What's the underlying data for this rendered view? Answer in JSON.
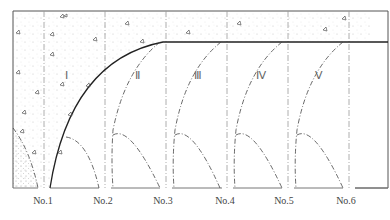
{
  "diagram": {
    "regions": [
      {
        "id": "I",
        "label": "Ⅰ",
        "x": 66,
        "y": 75
      },
      {
        "id": "II",
        "label": "Ⅱ",
        "x": 137,
        "y": 75
      },
      {
        "id": "III",
        "label": "Ⅲ",
        "x": 198,
        "y": 75
      },
      {
        "id": "IV",
        "label": "Ⅳ",
        "x": 261,
        "y": 75
      },
      {
        "id": "V",
        "label": "Ⅴ",
        "x": 319,
        "y": 75
      }
    ],
    "sections": [
      {
        "label": "No.1",
        "x": 43
      },
      {
        "label": "No.2",
        "x": 103
      },
      {
        "label": "No.3",
        "x": 163
      },
      {
        "label": "No.4",
        "x": 225
      },
      {
        "label": "No.5",
        "x": 284
      },
      {
        "label": "No.6",
        "x": 346
      }
    ],
    "caption": ""
  }
}
